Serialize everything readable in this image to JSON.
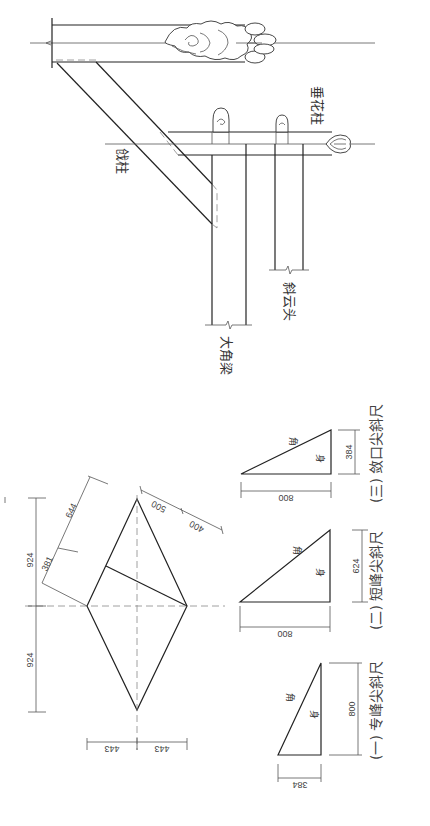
{
  "diagram": {
    "orientation": "rotated 90deg clockwise (text reads top-to-bottom)",
    "line_color": "#222222",
    "background": "#ffffff",
    "upper_elevation": {
      "labels": {
        "qiang_zhu": "戗柱",
        "chui_hua_zhu": "垂花柱",
        "da_jiao_liang": "大角梁",
        "xie_yun_tou": "斜云头"
      }
    },
    "plan_diamond": {
      "dims": {
        "upper_half": "924",
        "lower_half": "924",
        "left_half_width": "443",
        "right_half_width": "443",
        "edge_long": "644",
        "edge_short": "381",
        "edge_seg_a": "500",
        "edge_seg_b": "400"
      }
    },
    "bevel_rulers": [
      {
        "caption": "(一) 专峰尖斜尺",
        "tag_top": "角",
        "tag_side": "身",
        "base": "384",
        "height": "800"
      },
      {
        "caption": "(二) 短峰尖斜尺",
        "tag_top": "角",
        "tag_side": "身",
        "base": "800",
        "height": "624"
      },
      {
        "caption": "(三) 敛口尖斜尺",
        "tag_top": "角",
        "tag_side": "身",
        "base": "800",
        "height": "384"
      }
    ]
  }
}
